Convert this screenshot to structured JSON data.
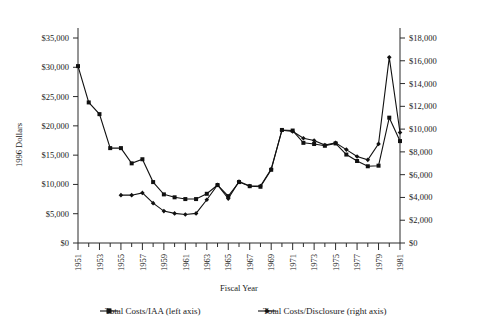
{
  "chart_data": {
    "type": "line",
    "title": "",
    "xlabel": "Fiscal Year",
    "ylabel": "1996 Dollars",
    "y2label": "",
    "grid": false,
    "legend_position": "bottom",
    "xlim": [
      1951,
      1981
    ],
    "ylim": [
      0,
      35000
    ],
    "y2lim": [
      0,
      18000
    ],
    "x": [
      1951,
      1952,
      1953,
      1954,
      1955,
      1956,
      1957,
      1958,
      1959,
      1960,
      1961,
      1962,
      1963,
      1964,
      1965,
      1966,
      1967,
      1968,
      1969,
      1970,
      1971,
      1972,
      1973,
      1974,
      1975,
      1976,
      1977,
      1978,
      1979,
      1980,
      1981
    ],
    "xtick_labels": [
      "1951",
      "",
      "1953",
      "",
      "1955",
      "",
      "1957",
      "",
      "1959",
      "",
      "1961",
      "",
      "1963",
      "",
      "1965",
      "",
      "1967",
      "",
      "1969",
      "",
      "1971",
      "",
      "1973",
      "",
      "1975",
      "",
      "1977",
      "",
      "1979",
      "",
      "1981"
    ],
    "ytick_labels": [
      "$0",
      "$5,000",
      "$10,000",
      "$15,000",
      "$20,000",
      "$25,000",
      "$30,000",
      "$35,000"
    ],
    "ytick_values": [
      0,
      5000,
      10000,
      15000,
      20000,
      25000,
      30000,
      35000
    ],
    "y2tick_labels": [
      "$0",
      "$2,000",
      "$4,000",
      "$6,000",
      "$8,000",
      "$10,000",
      "$12,000",
      "$14,000",
      "$16,000",
      "$18,000"
    ],
    "y2tick_values": [
      0,
      2000,
      4000,
      6000,
      8000,
      10000,
      12000,
      14000,
      16000,
      18000
    ],
    "series": [
      {
        "name": "Total Costs/IAA (left axis)",
        "axis": "left",
        "color": "#111111",
        "marker": "square",
        "x": [
          1951,
          1952,
          1953,
          1954,
          1955,
          1956,
          1957,
          1958,
          1959,
          1960,
          1961,
          1962,
          1963,
          1964,
          1965,
          1966,
          1967,
          1968,
          1969,
          1970,
          1971,
          1972,
          1973,
          1974,
          1975,
          1976,
          1977,
          1978,
          1979,
          1980,
          1981
        ],
        "values": [
          30200,
          24000,
          22000,
          16200,
          16200,
          13600,
          14300,
          10400,
          8300,
          7800,
          7500,
          7500,
          8400,
          9900,
          8000,
          10400,
          9700,
          9600,
          12500,
          19300,
          19200,
          17100,
          16900,
          16600,
          17000,
          15100,
          14000,
          13100,
          13200,
          21400,
          17400
        ]
      },
      {
        "name": "Total Costs/Disclosure (right axis)",
        "axis": "right",
        "color": "#111111",
        "marker": "diamond",
        "x": [
          1955,
          1956,
          1957,
          1958,
          1959,
          1960,
          1961,
          1962,
          1963,
          1964,
          1965,
          1966,
          1967,
          1968,
          1969,
          1970,
          1971,
          1972,
          1973,
          1974,
          1975,
          1976,
          1977,
          1978,
          1979,
          1980,
          1981
        ],
        "values": [
          4200,
          4200,
          4400,
          3500,
          2800,
          2600,
          2500,
          2600,
          3800,
          5100,
          3900,
          5400,
          5000,
          5000,
          6500,
          9900,
          9800,
          9200,
          9000,
          8600,
          8800,
          8200,
          7600,
          7300,
          8700,
          16300,
          9700
        ]
      }
    ]
  },
  "legend": {
    "items": [
      {
        "label": "Total Costs/IAA (left axis)"
      },
      {
        "label": "Total Costs/Disclosure (right axis)"
      }
    ]
  }
}
